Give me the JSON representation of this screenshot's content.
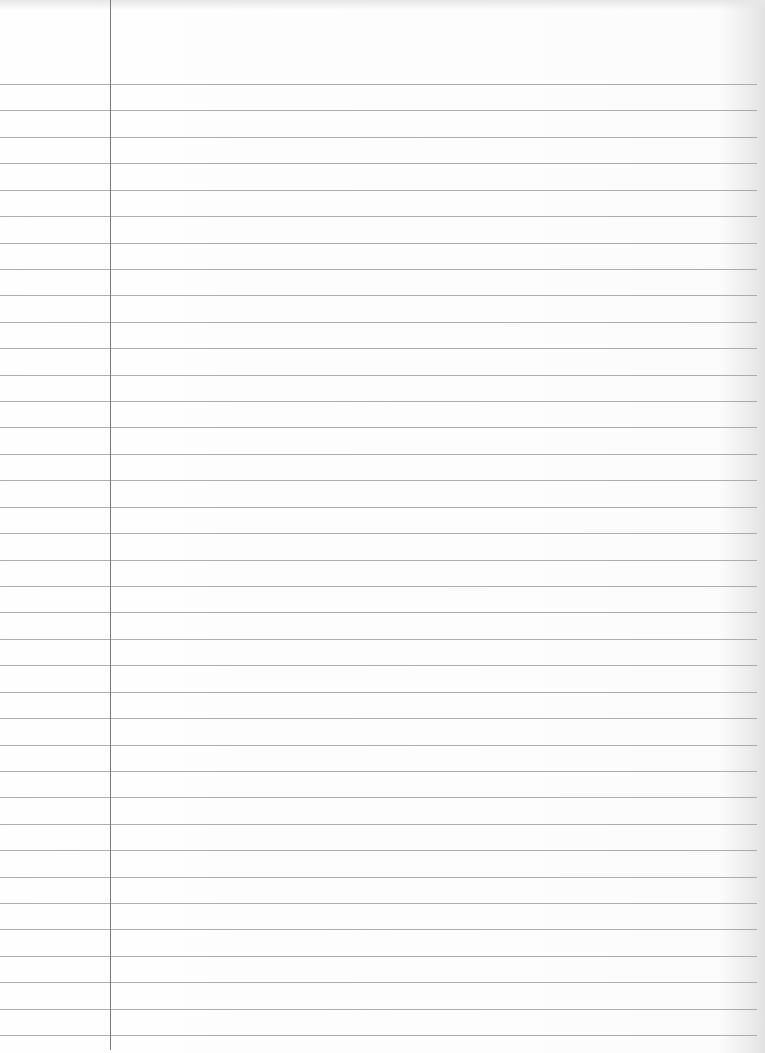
{
  "paper": {
    "type": "lined-notebook-paper",
    "background_color": "#fdfdfd",
    "rule_color": "#9a9a9a",
    "margin_color": "#7a7a7a",
    "margin_x": 110,
    "first_rule_y": 84,
    "rule_spacing": 26.42,
    "rule_count": 37,
    "rule_end_x": 757
  }
}
